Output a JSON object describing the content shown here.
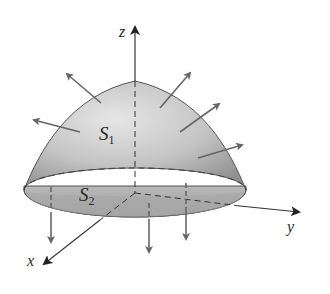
{
  "diagram": {
    "type": "surface-flux-diagram",
    "axes": {
      "z_label": "z",
      "y_label": "y",
      "x_label": "x"
    },
    "surfaces": {
      "top": {
        "label_main": "S",
        "label_sub": "1"
      },
      "bottom": {
        "label_main": "S",
        "label_sub": "2"
      }
    },
    "colors": {
      "surface_light": "#d8d8d8",
      "surface_dark": "#9a9a9a",
      "disk": "#a8a8a8",
      "stroke": "#555555",
      "arrow": "#666666",
      "axis": "#333333"
    },
    "normal_vectors_on_S1": 5,
    "normal_vectors_on_S2": 3
  }
}
